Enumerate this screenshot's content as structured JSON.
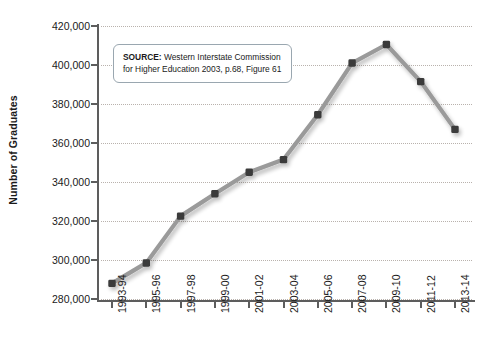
{
  "chart_data": {
    "type": "line",
    "title": "",
    "xlabel": "",
    "ylabel": "Number of Graduates",
    "categories": [
      "1993-94",
      "1995-96",
      "1997-98",
      "1999-00",
      "2001-02",
      "2003-04",
      "2005-06",
      "2007-08",
      "2009-10",
      "2011-12",
      "2013-14"
    ],
    "values": [
      288000,
      298500,
      322500,
      334000,
      345000,
      351500,
      374500,
      401000,
      410500,
      391500,
      367000
    ],
    "ylim": [
      280000,
      420000
    ],
    "yticks": [
      280000,
      300000,
      320000,
      340000,
      360000,
      380000,
      400000,
      420000
    ],
    "ytick_labels": [
      "280,000",
      "300,000",
      "320,000",
      "340,000",
      "360,000",
      "380,000",
      "400,000",
      "420,000"
    ],
    "grid": true,
    "legend": "none",
    "series_color": "#9a9a9a",
    "marker_color": "#3a3a3a",
    "gridline_color": "#b9b2ad",
    "axis_color": "#5d5d5d",
    "annotations": [
      {
        "name": "source-callout",
        "label": "SOURCE:",
        "text": " Western Interstate Commission for Higher Education 2003, p.68, Figure 61"
      }
    ]
  },
  "axis": {
    "y_title": "Number of Graduates"
  },
  "source": {
    "label": "SOURCE:",
    "text": " Western Interstate Commission for Higher Education 2003, p.68, Figure 61"
  }
}
